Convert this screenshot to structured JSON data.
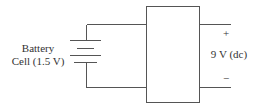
{
  "diagram": {
    "battery_label": {
      "line1": "Battery",
      "line2": "Cell (1.5 V)"
    },
    "output": {
      "plus": "+",
      "minus": "−",
      "label": "9 V (dc)"
    },
    "colors": {
      "line": "#555555",
      "text": "#333333",
      "background": "#ffffff"
    }
  }
}
